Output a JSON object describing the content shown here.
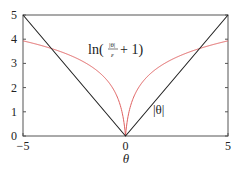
{
  "chart_data": {
    "type": "line",
    "title": "",
    "xlabel": "θ",
    "ylabel": "",
    "xlim": [
      -5,
      5
    ],
    "ylim": [
      0,
      5
    ],
    "x_ticks": [
      -5,
      0,
      5
    ],
    "y_ticks": [
      0,
      1,
      2,
      3,
      4,
      5
    ],
    "x_tick_labels": [
      "−5",
      "0",
      "5"
    ],
    "y_tick_labels": [
      "0",
      "1",
      "2",
      "3",
      "4",
      "5"
    ],
    "grid": false,
    "legend": null,
    "epsilon": 0.1,
    "series": [
      {
        "name": "|θ|",
        "color": "#222222",
        "expression": "|theta|",
        "x": [
          -5,
          0,
          5
        ],
        "y": [
          5,
          0,
          5
        ]
      },
      {
        "name": "ln(|θ|/ε + 1)",
        "color": "#e06060",
        "expression": "ln(|theta|/epsilon + 1)",
        "x": [
          -5,
          -4,
          -3,
          -2,
          -1,
          -0.5,
          -0.1,
          0,
          0.1,
          0.5,
          1,
          2,
          3,
          4,
          5
        ],
        "y": [
          3.93,
          3.71,
          3.43,
          3.04,
          2.4,
          1.79,
          0.69,
          0,
          0.69,
          1.79,
          2.4,
          3.04,
          3.43,
          3.71,
          3.93
        ]
      }
    ],
    "annotations": [
      {
        "text_main": "ln(",
        "frac_num": "|θ|",
        "frac_den": "ε",
        "text_tail": "+ 1)",
        "x": -1.8,
        "y": 3.4
      },
      {
        "text": "|θ|",
        "x": 1.7,
        "y": 1.2
      }
    ]
  }
}
